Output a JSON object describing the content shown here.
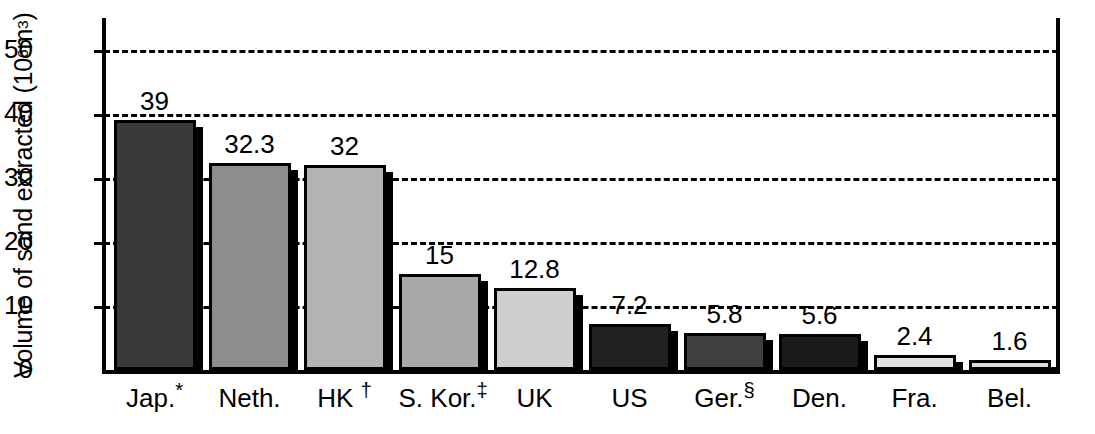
{
  "chart_data": {
    "type": "bar",
    "title": "",
    "xlabel": "",
    "ylabel": "Volume of sand extracted (10⁶ m³)",
    "ylabel_text": "Volume of sand extracted (10",
    "ylabel_sup": "6",
    "ylabel_tail": " m",
    "ylabel_sup2": "3",
    "ylabel_close": ")",
    "ylim": [
      0,
      55
    ],
    "yticks": [
      0,
      10,
      20,
      30,
      40,
      50
    ],
    "ytick_labels": [
      "0",
      "10",
      "20",
      "30",
      "40",
      "50"
    ],
    "grid": "horizontal-dashed",
    "legend": "none",
    "categories": [
      "Jap.*",
      "Neth.",
      "HK †",
      "S. Kor.‡",
      "UK",
      "US",
      "Ger.§",
      "Den.",
      "Fra.",
      "Bel."
    ],
    "values": [
      39,
      32.3,
      32,
      15,
      12.8,
      7.2,
      5.8,
      5.6,
      2.4,
      1.6
    ],
    "value_labels": [
      "39",
      "32.3",
      "32",
      "15",
      "12.8",
      "7.2",
      "5.8",
      "5.6",
      "2.4",
      "1.6"
    ],
    "bar_colors": [
      "#3a3a3a",
      "#8e8e8e",
      "#b4b4b4",
      "#a8a8a8",
      "#cfcfcf",
      "#212121",
      "#3f3f3f",
      "#1a1a1a",
      "#e2e2e2",
      "#dcdcdc"
    ],
    "bars": [
      {
        "label_base": "Jap.",
        "label_marker": "*",
        "value_label": "39",
        "value": 39,
        "color": "#3a3a3a"
      },
      {
        "label_base": "Neth.",
        "label_marker": "",
        "value_label": "32.3",
        "value": 32.3,
        "color": "#8e8e8e"
      },
      {
        "label_base": "HK ",
        "label_marker": "†",
        "value_label": "32",
        "value": 32,
        "color": "#b4b4b4"
      },
      {
        "label_base": "S. Kor.",
        "label_marker": "‡",
        "value_label": "15",
        "value": 15,
        "color": "#a8a8a8"
      },
      {
        "label_base": "UK",
        "label_marker": "",
        "value_label": "12.8",
        "value": 12.8,
        "color": "#cfcfcf"
      },
      {
        "label_base": "US",
        "label_marker": "",
        "value_label": "7.2",
        "value": 7.2,
        "color": "#212121"
      },
      {
        "label_base": "Ger.",
        "label_marker": "§",
        "value_label": "5.8",
        "value": 5.8,
        "color": "#3f3f3f"
      },
      {
        "label_base": "Den.",
        "label_marker": "",
        "value_label": "5.6",
        "value": 5.6,
        "color": "#1a1a1a"
      },
      {
        "label_base": "Fra.",
        "label_marker": "",
        "value_label": "2.4",
        "value": 2.4,
        "color": "#e2e2e2"
      },
      {
        "label_base": "Bel.",
        "label_marker": "",
        "value_label": "1.6",
        "value": 1.6,
        "color": "#dcdcdc"
      }
    ]
  }
}
